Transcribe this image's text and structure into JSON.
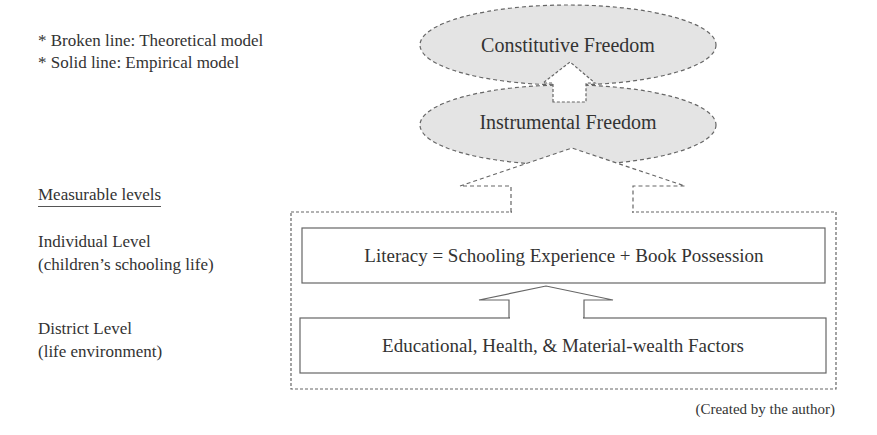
{
  "legend": {
    "items": [
      "* Broken line: Theoretical model",
      "* Solid line: Empirical model"
    ]
  },
  "levels": {
    "heading": "Measurable levels",
    "individual": {
      "title": "Individual Level",
      "subtitle": "(children’s schooling life)"
    },
    "district": {
      "title": "District Level",
      "subtitle": "(life environment)"
    }
  },
  "nodes": {
    "constitutive_freedom": "Constitutive Freedom",
    "instrumental_freedom": "Instrumental Freedom",
    "literacy": "Literacy = Schooling Experience + Book Possession",
    "factors": "Educational, Health, & Material-wealth Factors"
  },
  "credit": "(Created by the author)",
  "colors": {
    "ellipse_fill": "#e4e4e4",
    "line": "#666666",
    "text": "#333333"
  }
}
